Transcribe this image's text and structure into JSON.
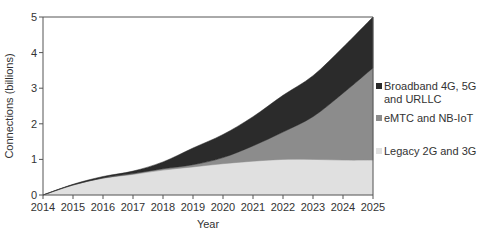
{
  "chart_data": {
    "type": "area",
    "stacked": true,
    "title": "",
    "xlabel": "Year",
    "ylabel": "Connections (billions)",
    "x": [
      2014,
      2015,
      2016,
      2017,
      2018,
      2019,
      2020,
      2021,
      2022,
      2023,
      2024,
      2025
    ],
    "xlim": [
      2014,
      2025
    ],
    "ylim": [
      0,
      5
    ],
    "xticks": [
      "2014",
      "2015",
      "2016",
      "2017",
      "2018",
      "2019",
      "2020",
      "2021",
      "2022",
      "2023",
      "2024",
      "2025"
    ],
    "yticks": [
      "0",
      "1",
      "2",
      "3",
      "4",
      "5"
    ],
    "grid": false,
    "legend_position": "right",
    "series": [
      {
        "name": "Legacy 2G and 3G",
        "color": "#e0e0e0",
        "values": [
          0,
          0.28,
          0.47,
          0.58,
          0.7,
          0.79,
          0.88,
          0.95,
          1.0,
          1.0,
          0.98,
          0.98
        ]
      },
      {
        "name": "eMTC and NB-IoT",
        "color": "#8c8c8c",
        "values": [
          0,
          0.0,
          0.01,
          0.02,
          0.04,
          0.06,
          0.17,
          0.43,
          0.77,
          1.2,
          1.88,
          2.59
        ]
      },
      {
        "name": "Broadband 4G, 5G and URLLC",
        "color": "#2b2b2b",
        "values": [
          0,
          0.02,
          0.04,
          0.07,
          0.19,
          0.47,
          0.65,
          0.82,
          1.03,
          1.15,
          1.29,
          1.43
        ]
      }
    ]
  },
  "legend": {
    "items": [
      {
        "label": "Broadband 4G, 5G\nand URLLC",
        "color": "#2b2b2b"
      },
      {
        "label": "eMTC and NB-IoT",
        "color": "#8c8c8c"
      },
      {
        "label": "Legacy 2G and 3G",
        "color": "#e0e0e0"
      }
    ]
  }
}
